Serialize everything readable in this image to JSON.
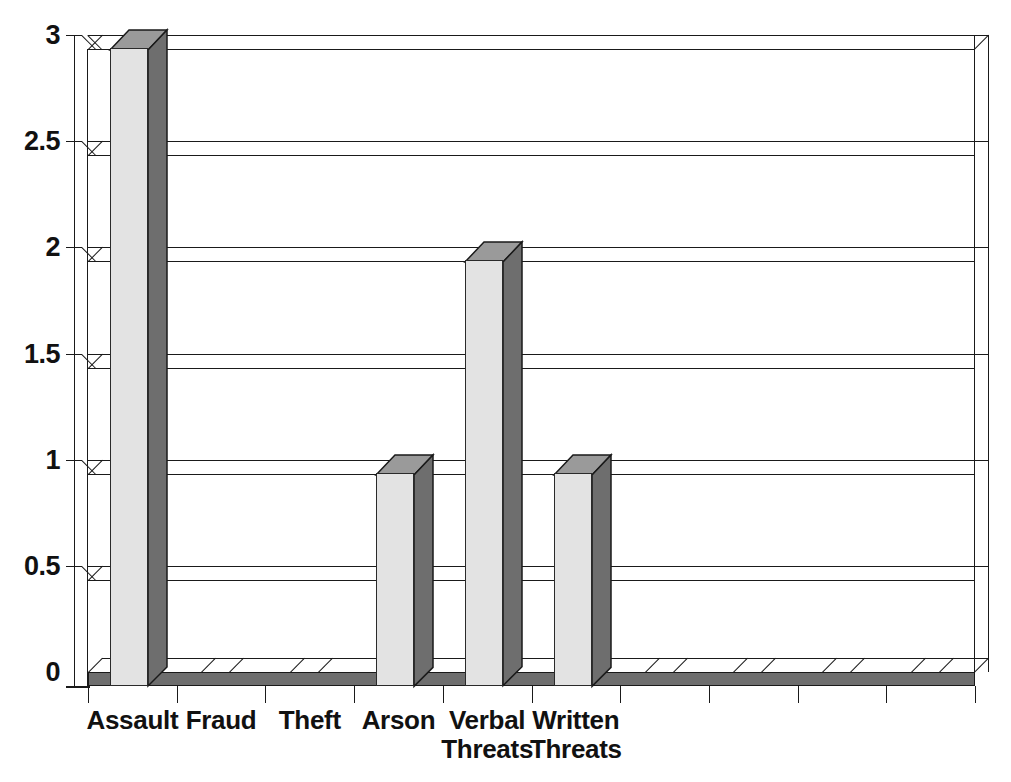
{
  "chart_data": {
    "type": "bar",
    "title": "",
    "subtitle": "",
    "xlabel": "",
    "ylabel": "",
    "categories": [
      "Assault",
      "Fraud",
      "Theft",
      "Arson",
      "Verbal\nThreats",
      "Written\nThreats",
      "",
      "",
      "",
      ""
    ],
    "values": [
      3,
      0,
      0,
      1,
      2,
      1,
      0,
      0,
      0,
      0
    ],
    "ylim": [
      0,
      3
    ],
    "ytick_values": [
      0,
      0.5,
      1,
      1.5,
      2,
      2.5,
      3
    ],
    "ytick_labels": [
      "0",
      "0.5",
      "1",
      "1.5",
      "2",
      "2.5",
      "3"
    ],
    "grid": true,
    "legend": false,
    "style": "3d-column",
    "colors": {
      "bar_front": "#e3e3e3",
      "bar_side": "#6e6e6e",
      "bar_top": "#9a9a9a",
      "floor": "#6e6e6e",
      "outline": "#1a1a1a",
      "background": "#ffffff",
      "text": "#111111"
    }
  },
  "axis": {
    "y_labels": [
      {
        "text": "3",
        "value": 3
      },
      {
        "text": "2.5",
        "value": 2.5
      },
      {
        "text": "2",
        "value": 2
      },
      {
        "text": "1.5",
        "value": 1.5
      },
      {
        "text": "1",
        "value": 1
      },
      {
        "text": "0.5",
        "value": 0.5
      },
      {
        "text": "0",
        "value": 0
      }
    ],
    "x_labels": [
      {
        "text": "Assault"
      },
      {
        "text": "Fraud"
      },
      {
        "text": "Theft"
      },
      {
        "text": "Arson"
      },
      {
        "text": "Verbal\nThreats"
      },
      {
        "text": "Written\nThreats"
      },
      {
        "text": ""
      },
      {
        "text": ""
      },
      {
        "text": ""
      },
      {
        "text": ""
      }
    ]
  }
}
